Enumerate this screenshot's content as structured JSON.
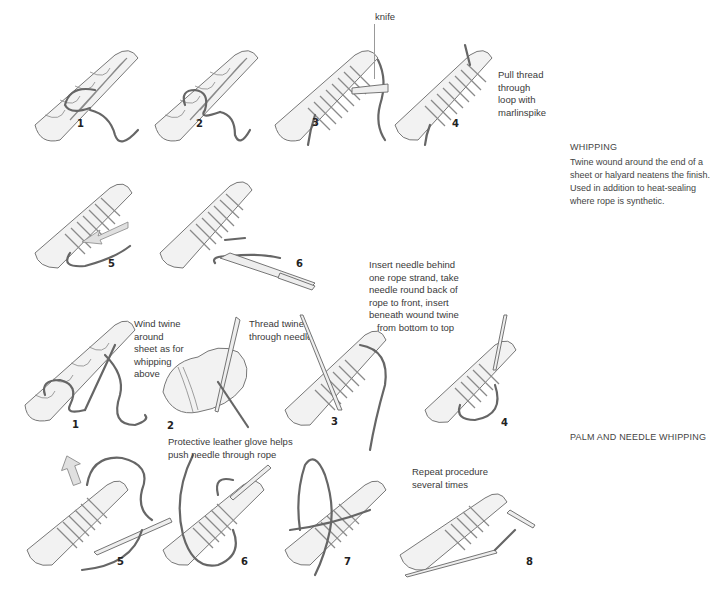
{
  "sections": {
    "whipping": {
      "title": "WHIPPING",
      "description": "Twine wound around the end of a sheet or halyard neatens the finish. Used in addition to heat-sealing where rope is synthetic.",
      "steps": [
        {
          "number": "1"
        },
        {
          "number": "2"
        },
        {
          "number": "3",
          "label": "knife"
        },
        {
          "number": "4",
          "note": "Pull thread through loop with marlinspike"
        },
        {
          "number": "5"
        },
        {
          "number": "6"
        }
      ]
    },
    "palm_needle": {
      "title": "PALM AND NEEDLE WHIPPING",
      "steps": [
        {
          "number": "1",
          "note": "Wind twine around sheet as for whipping above"
        },
        {
          "number": "2",
          "note": "Thread twine through needle"
        },
        {
          "number": "3",
          "note": "Insert needle behind one rope strand, take needle round back of rope to front, insert beneath wound twine from bottom to top"
        },
        {
          "number": "4"
        },
        {
          "number": "5"
        },
        {
          "number": "6",
          "note": "Protective leather glove helps push needle through rope"
        },
        {
          "number": "7"
        },
        {
          "number": "8",
          "note": "Repeat procedure several times"
        }
      ]
    }
  },
  "captions_lines": {
    "w4": [
      "Pull thread",
      "through",
      "loop with",
      "marlinspike"
    ],
    "p1": [
      "Wind twine",
      "around",
      "sheet as for",
      "whipping",
      "above"
    ],
    "p2": [
      "Thread twine",
      "through needle"
    ],
    "p3": [
      "Insert needle behind",
      "one rope strand, take",
      "needle round back of",
      "rope to front, insert",
      "beneath wound twine",
      "from bottom to top"
    ],
    "p6": [
      "Protective leather glove helps",
      "push needle through rope"
    ],
    "p8": [
      "Repeat procedure",
      "several times"
    ]
  }
}
